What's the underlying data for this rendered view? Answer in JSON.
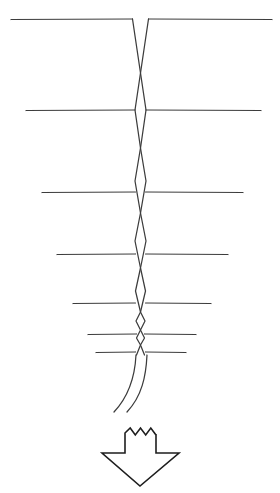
{
  "figure": {
    "title": "Braided Strand Diagram",
    "kind": "line-art-diagram",
    "canvas": {
      "width": 280,
      "height": 493,
      "background": "#ffffff"
    },
    "colors": {
      "stroke": "#3c3c3c",
      "arrow_stroke": "#1e1e1e",
      "background": "#ffffff"
    },
    "strands": {
      "name": "braided-pair",
      "count": 2,
      "stroke_width": 1.25,
      "axis_x": 140.5,
      "description": "Two strands weaving around a vertical axis, crossing at narrowing intervals and bulging into lens shapes between crossings.",
      "crossing_y": [
        73,
        148,
        213,
        268,
        312,
        330,
        345
      ],
      "bulge_y": [
        110,
        181,
        241,
        291,
        321,
        338
      ],
      "bulge_half_width": [
        5.5,
        5.5,
        5.5,
        5.0,
        4.5,
        4.0
      ],
      "top_y": 19,
      "top_half_width": 8,
      "tail_start_y": 355,
      "tail_end_y": 413
    },
    "crossbars": {
      "name": "horizontal-crossbars",
      "count": 7,
      "description": "Horizontal lines crossing the braid, shortening toward the bottom.",
      "lines": [
        {
          "y": 19,
          "x1": 11,
          "x2": 272,
          "left_len": 121,
          "right_len": 131
        },
        {
          "y": 110,
          "x1": 26,
          "x2": 261,
          "left_len": 114,
          "right_len": 120
        },
        {
          "y": 192,
          "x1": 42,
          "x2": 243,
          "left_len": 98,
          "right_len": 102
        },
        {
          "y": 254,
          "x1": 57,
          "x2": 228,
          "left_len": 83,
          "right_len": 87
        },
        {
          "y": 303,
          "x1": 73,
          "x2": 211,
          "left_len": 67,
          "right_len": 70
        },
        {
          "y": 334,
          "x1": 88,
          "x2": 196,
          "left_len": 52,
          "right_len": 55
        },
        {
          "y": 352,
          "x1": 96,
          "x2": 186,
          "left_len": 44,
          "right_len": 45
        }
      ]
    },
    "tails": {
      "name": "curved-tails",
      "count": 2,
      "description": "Two strands continue below the last crossbar and curve gently to the lower left, ending free.",
      "left_tail": {
        "start_x": 136,
        "start_y": 355,
        "end_x": 114,
        "end_y": 412
      },
      "right_tail": {
        "start_x": 147,
        "start_y": 355,
        "end_x": 127,
        "end_y": 412
      }
    },
    "arrow": {
      "name": "down-arrow",
      "direction": "down",
      "description": "Outlined downward arrow with a torn, zig-zag top edge.",
      "stroke": "#1e1e1e",
      "tip_x": 140,
      "tip_y": 486,
      "top_y": 428,
      "shaft_left_x": 125,
      "shaft_right_x": 156,
      "head_left_x": 102,
      "head_right_x": 179,
      "head_top_y": 453,
      "jag_peaks": 3
    }
  }
}
